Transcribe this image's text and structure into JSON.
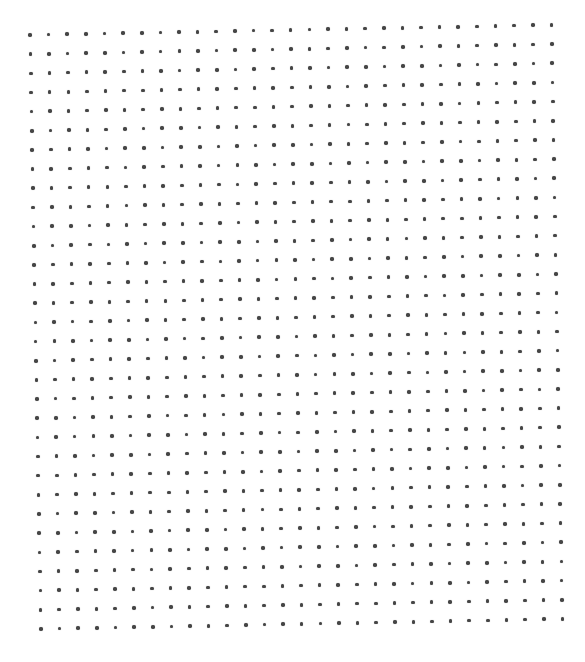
{
  "page": {
    "type": "dot-grid-sheet",
    "background_color": "#ffffff"
  },
  "grid": {
    "rows": 32,
    "columns": 29,
    "origin": {
      "x": 30,
      "y": 35
    },
    "column_step": {
      "dx": 18.62,
      "dy": -0.36
    },
    "row_step": {
      "dx": 0.355,
      "dy": 19.16
    },
    "dot_color": "#454545",
    "dot_diameter": 3.6,
    "corners": {
      "top_left": {
        "x": 30,
        "y": 35
      },
      "top_right": {
        "x": 551,
        "y": 25
      },
      "bottom_left": {
        "x": 41,
        "y": 629
      },
      "bottom_right": {
        "x": 561,
        "y": 619
      }
    }
  }
}
